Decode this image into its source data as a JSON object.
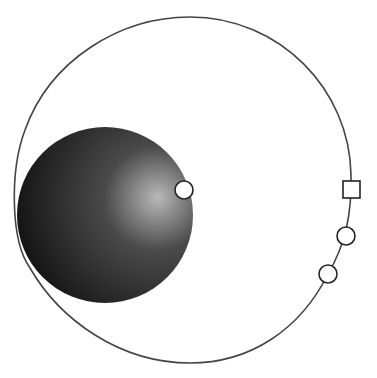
{
  "diagram": {
    "type": "orbit-diagram",
    "background": "#ffffff",
    "orbit": {
      "stroke": "#444444",
      "stroke_width": 1.6,
      "center_x": 183,
      "center_y": 190,
      "radius_x": 168,
      "radius_y": 173
    },
    "body": {
      "center_x": 105,
      "center_y": 215,
      "radius": 88,
      "gradient_light": "#b8b8b8",
      "gradient_mid": "#4a4a4a",
      "gradient_dark": "#0e0e0e"
    },
    "markers": [
      {
        "shape": "circle",
        "x": 184,
        "y": 190,
        "size": 9
      },
      {
        "shape": "square",
        "x": 351,
        "y": 190,
        "size": 17
      },
      {
        "shape": "circle",
        "x": 346,
        "y": 236,
        "size": 9
      },
      {
        "shape": "circle",
        "x": 328,
        "y": 274,
        "size": 9
      }
    ]
  }
}
